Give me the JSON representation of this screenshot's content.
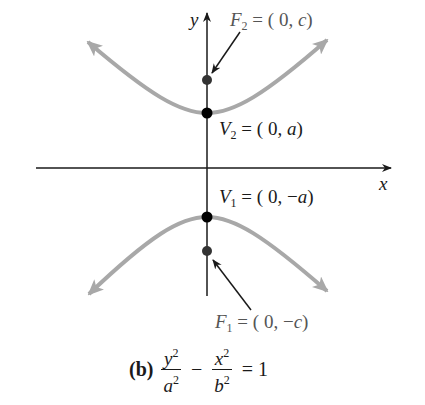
{
  "figure": {
    "axes": {
      "x_label": "x",
      "y_label": "y"
    },
    "points": {
      "F2": {
        "name": "F",
        "sub": "2",
        "text": " = ( 0, ",
        "coord": "c",
        "close": ")"
      },
      "V2": {
        "name": "V",
        "sub": "2",
        "text": " = ( 0, ",
        "coord": "a",
        "close": ")"
      },
      "V1": {
        "name": "V",
        "sub": "1",
        "text": " = ( 0, −",
        "coord": "a",
        "close": ")"
      },
      "F1": {
        "name": "F",
        "sub": "1",
        "text": " = ( 0, −",
        "coord": "c",
        "close": ")"
      }
    },
    "caption": {
      "part": "(b)",
      "term1_num": "y",
      "term1_den": "a",
      "term2_num": "x",
      "term2_den": "b",
      "exp": "2",
      "minus": "−",
      "equals": "= 1"
    },
    "colors": {
      "curve": "#a8a8a8",
      "axis": "#1a1a1a",
      "vertex": "#000000",
      "focus": "#333333"
    }
  }
}
